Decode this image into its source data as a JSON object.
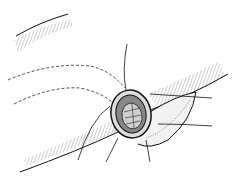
{
  "image": {
    "description": "Line-art surgical illustration of a circular anastomosis/stoma with sutures on hatched tissue bands",
    "background": "#ffffff",
    "stroke": "#1a1a1a",
    "width": 239,
    "height": 182
  }
}
